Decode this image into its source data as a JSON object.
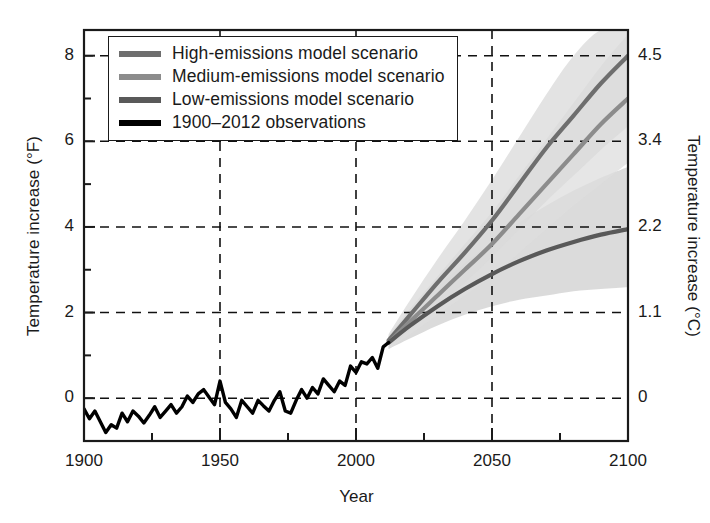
{
  "chart_data": {
    "type": "line",
    "title": "",
    "xlabel": "Year",
    "ylabel": "Temperature increase (°F)",
    "ylabel_right": "Temperature increase (°C)",
    "xlim": [
      1900,
      2100
    ],
    "ylim": [
      -1,
      8.6
    ],
    "grid": true,
    "grid_style": "dashed",
    "legend_position": "top-left",
    "xticks": [
      1900,
      1950,
      2000,
      2050,
      2100
    ],
    "xticks_minor_interval": 25,
    "yticks_left": [
      0,
      2,
      4,
      6,
      8
    ],
    "yticks_minor_interval": 1,
    "yticks_right": [
      {
        "f": 0,
        "label": "0"
      },
      {
        "f": 2,
        "label": "1.1"
      },
      {
        "f": 4,
        "label": "2.2"
      },
      {
        "f": 6,
        "label": "3.4"
      },
      {
        "f": 8,
        "label": "4.5"
      }
    ],
    "series": [
      {
        "name": "High-emissions model scenario",
        "color": "#6e6e6e",
        "band_color": "#d9d9d9",
        "x": [
          2012,
          2020,
          2030,
          2040,
          2050,
          2060,
          2070,
          2080,
          2090,
          2100
        ],
        "values": [
          1.35,
          1.95,
          2.7,
          3.4,
          4.15,
          5.0,
          5.85,
          6.6,
          7.35,
          8.0
        ],
        "band_low": [
          1.2,
          1.6,
          2.15,
          2.7,
          3.3,
          3.95,
          4.6,
          5.2,
          5.8,
          6.35
        ],
        "band_high": [
          1.5,
          2.3,
          3.25,
          4.15,
          5.1,
          6.1,
          7.1,
          8.0,
          8.9,
          9.7
        ]
      },
      {
        "name": "Medium-emissions model scenario",
        "color": "#8c8c8c",
        "band_color": "#dedede",
        "x": [
          2012,
          2020,
          2030,
          2040,
          2050,
          2060,
          2070,
          2080,
          2090,
          2100
        ],
        "values": [
          1.3,
          1.8,
          2.4,
          3.0,
          3.6,
          4.3,
          5.0,
          5.7,
          6.4,
          7.0
        ],
        "band_low": [
          1.15,
          1.5,
          1.95,
          2.4,
          2.85,
          3.4,
          3.95,
          4.5,
          5.0,
          5.5
        ],
        "band_high": [
          1.45,
          2.1,
          2.85,
          3.6,
          4.35,
          5.2,
          6.05,
          6.9,
          7.75,
          8.5
        ]
      },
      {
        "name": "Low-emissions model scenario",
        "color": "#595959",
        "band_color": "#cfcfcf",
        "x": [
          2012,
          2020,
          2030,
          2040,
          2050,
          2060,
          2070,
          2080,
          2090,
          2100
        ],
        "values": [
          1.3,
          1.7,
          2.15,
          2.55,
          2.9,
          3.2,
          3.45,
          3.65,
          3.82,
          3.95
        ],
        "band_low": [
          1.15,
          1.4,
          1.7,
          1.95,
          2.15,
          2.3,
          2.4,
          2.5,
          2.55,
          2.6
        ],
        "band_high": [
          1.45,
          2.0,
          2.6,
          3.15,
          3.65,
          4.1,
          4.5,
          4.85,
          5.15,
          5.4
        ]
      },
      {
        "name": "1900–2012 observations",
        "color": "#000000",
        "x": [
          1900,
          1902,
          1904,
          1906,
          1908,
          1910,
          1912,
          1914,
          1916,
          1918,
          1920,
          1922,
          1924,
          1926,
          1928,
          1930,
          1932,
          1934,
          1936,
          1938,
          1940,
          1942,
          1944,
          1946,
          1948,
          1950,
          1952,
          1954,
          1956,
          1958,
          1960,
          1962,
          1964,
          1966,
          1968,
          1970,
          1972,
          1974,
          1976,
          1978,
          1980,
          1982,
          1984,
          1986,
          1988,
          1990,
          1992,
          1994,
          1996,
          1998,
          2000,
          2002,
          2004,
          2006,
          2008,
          2010,
          2012
        ],
        "values": [
          -0.25,
          -0.48,
          -0.3,
          -0.55,
          -0.8,
          -0.62,
          -0.7,
          -0.35,
          -0.55,
          -0.3,
          -0.42,
          -0.58,
          -0.4,
          -0.2,
          -0.45,
          -0.3,
          -0.15,
          -0.35,
          -0.2,
          0.05,
          -0.1,
          0.1,
          0.2,
          0.02,
          -0.15,
          0.4,
          -0.1,
          -0.25,
          -0.45,
          -0.05,
          -0.2,
          -0.35,
          -0.05,
          -0.18,
          -0.3,
          -0.05,
          0.15,
          -0.3,
          -0.35,
          -0.05,
          0.2,
          0.0,
          0.25,
          0.1,
          0.45,
          0.3,
          0.15,
          0.4,
          0.3,
          0.75,
          0.6,
          0.85,
          0.8,
          0.95,
          0.7,
          1.2,
          1.3
        ]
      }
    ]
  },
  "legend": {
    "items": [
      {
        "label": "High-emissions model scenario",
        "color": "#6e6e6e"
      },
      {
        "label": "Medium-emissions model scenario",
        "color": "#8c8c8c"
      },
      {
        "label": "Low-emissions model scenario",
        "color": "#595959"
      },
      {
        "label": "1900–2012 observations",
        "color": "#000000"
      }
    ]
  },
  "axes": {
    "xlabel": "Year",
    "ylabel_left": "Temperature increase (°F)",
    "ylabel_right": "Temperature increase (°C)",
    "xticks": [
      "1900",
      "1950",
      "2000",
      "2050",
      "2100"
    ],
    "yticks_left": [
      "0",
      "2",
      "4",
      "6",
      "8"
    ],
    "yticks_right": [
      "0",
      "1.1",
      "2.2",
      "3.4",
      "4.5"
    ]
  }
}
